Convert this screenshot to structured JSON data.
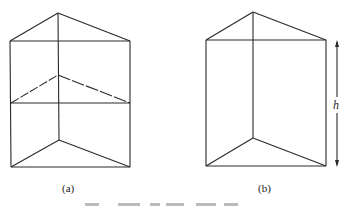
{
  "figure": {
    "panels": [
      {
        "id": "a",
        "label": "(a)",
        "description": "Triangular prism divided into two stacked triangular prisms by a horizontal cross-section",
        "vertices": {
          "top_apex": [
            58,
            13
          ],
          "top_left": [
            10,
            41
          ],
          "top_right": [
            130,
            41
          ],
          "mid_apex": [
            58,
            75
          ],
          "mid_left": [
            11,
            103
          ],
          "mid_right": [
            130,
            103
          ],
          "bottom_back": [
            59,
            140
          ],
          "bottom_left": [
            11,
            167
          ],
          "bottom_right": [
            130,
            167
          ]
        },
        "label_pos": [
          69,
          191
        ]
      },
      {
        "id": "b",
        "label": "(b)",
        "description": "Triangular prism of height h",
        "vertices": {
          "top_apex": [
            253,
            12
          ],
          "top_left": [
            206,
            40
          ],
          "top_right": [
            326,
            40
          ],
          "bottom_back": [
            253,
            138
          ],
          "bottom_left": [
            206,
            166
          ],
          "bottom_right": [
            326,
            166
          ]
        },
        "dimension": {
          "symbol": "h",
          "x": 337,
          "y_top": 41,
          "y_bottom": 166
        },
        "label_pos": [
          265,
          191
        ]
      }
    ],
    "line_color": "#2a2a2a"
  }
}
